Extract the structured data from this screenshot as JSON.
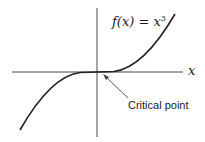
{
  "diagram": {
    "function_label": "f(x) = x",
    "function_exponent": "3",
    "x_axis_label": "x",
    "annotation": "Critical point",
    "curve_color": "#222222",
    "axis_color": "#333333"
  }
}
